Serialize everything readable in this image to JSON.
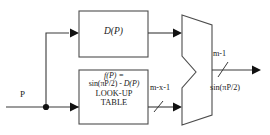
{
  "diagram": {
    "type": "block-diagram",
    "background_color": "#ffffff",
    "line_color": "#3a3a3a",
    "block_border_color": "#4d4d4d"
  },
  "input": {
    "label": "P"
  },
  "blocks": {
    "coarse": {
      "label": "D(P)"
    },
    "lookup_table": {
      "line1": "f(P) =",
      "line2_prefix": "sin(",
      "line2_pi": "π",
      "line2_mid": "P/2) - ",
      "line2_func": "D(P)",
      "line2_full": "sin(πP/2) - D(P)",
      "line3": "LOOK-UP",
      "line4": "TABLE"
    }
  },
  "mux": {
    "name": "multiplexer"
  },
  "wires": {
    "lut_bus_width": "m-x-1",
    "output_bus_width": "m-1",
    "output_label": "sin(πP/2)"
  }
}
